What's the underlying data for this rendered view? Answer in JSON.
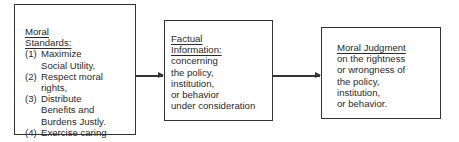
{
  "boxes": {
    "standards": {
      "title_line1": "Moral",
      "title_line2": "Standards:",
      "items": [
        {
          "num": "(1)",
          "lines": [
            "Maximize",
            "Social Utility,"
          ]
        },
        {
          "num": "(2)",
          "lines": [
            "Respect moral",
            "rights,"
          ]
        },
        {
          "num": "(3)",
          "lines": [
            "Distribute",
            "Benefits and",
            "Burdens Justly."
          ]
        },
        {
          "num": "(4)",
          "lines": [
            "Exercise caring"
          ]
        }
      ]
    },
    "facts": {
      "title_line1": "Factual",
      "title_line2": "Information:",
      "lines": [
        "concerning",
        "the policy,",
        "institution,",
        "or behavior",
        "under consideration"
      ]
    },
    "judgment": {
      "title": "Moral Judgment",
      "lines": [
        "on the rightness",
        "or wrongness of",
        "the policy,",
        "institution,",
        "or behavior."
      ]
    }
  },
  "arrows": [
    {
      "from": "standards",
      "to": "facts"
    },
    {
      "from": "facts",
      "to": "judgment"
    }
  ]
}
